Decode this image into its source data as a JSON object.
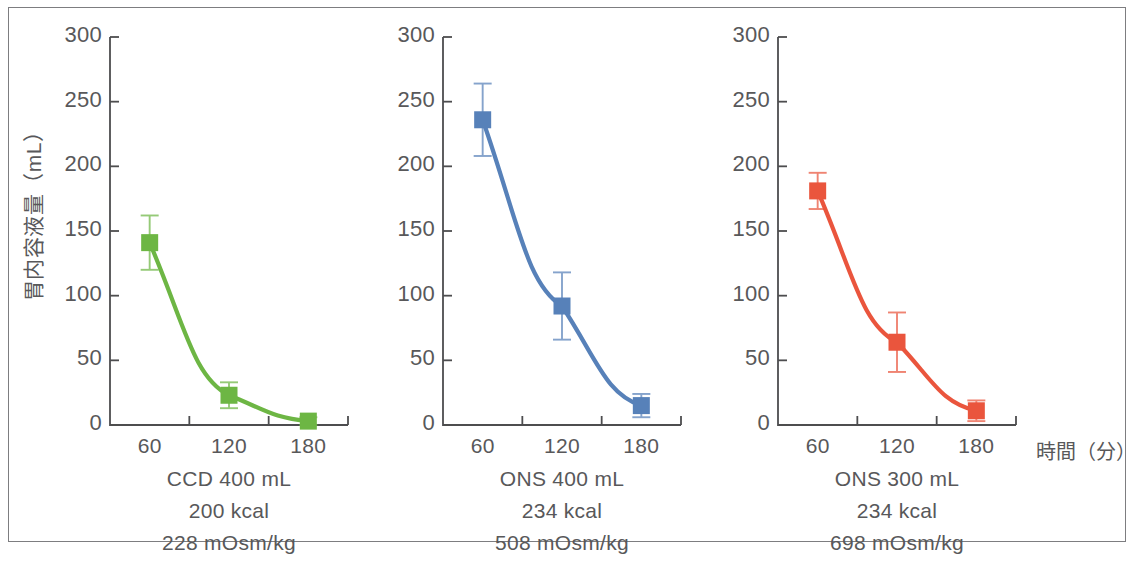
{
  "figure": {
    "y_axis_title": "胃内容液量（mL）",
    "x_axis_title": "時間（分）"
  },
  "chart_data": {
    "type": "line",
    "title": "",
    "subtitle": "",
    "xlabel": "時間（分）",
    "ylabel": "胃内容液量（mL）",
    "x": [
      60,
      120,
      180
    ],
    "xlim": [
      30,
      210
    ],
    "ylim": [
      0,
      300
    ],
    "yticks": [
      0,
      50,
      100,
      150,
      200,
      250,
      300
    ],
    "xticks": [
      60,
      120,
      180
    ],
    "grid": false,
    "legend": "none",
    "marker": "square",
    "error_bars": "mean ± SD",
    "panels": [
      {
        "id": "panel-ccd-400",
        "caption_lines": [
          "CCD 400 mL",
          "200 kcal",
          "228 mOsm/kg"
        ],
        "product": "CCD 400 mL",
        "energy": "200 kcal",
        "osmolality": "228 mOsm/kg",
        "color": "#6DB644",
        "series_name": "CCD 400 mL",
        "values": [
          141,
          23,
          3
        ],
        "errors": [
          21,
          10,
          3
        ]
      },
      {
        "id": "panel-ons-400",
        "caption_lines": [
          "ONS 400 mL",
          "234 kcal",
          "508 mOsm/kg"
        ],
        "product": "ONS 400 mL",
        "energy": "234 kcal",
        "osmolality": "508 mOsm/kg",
        "color": "#5781B9",
        "series_name": "ONS 400 mL",
        "values": [
          236,
          92,
          15
        ],
        "errors": [
          28,
          26,
          9
        ]
      },
      {
        "id": "panel-ons-300",
        "caption_lines": [
          "ONS 300 mL",
          "234 kcal",
          "698 mOsm/kg"
        ],
        "product": "ONS 300 mL",
        "energy": "234 kcal",
        "osmolality": "698 mOsm/kg",
        "color": "#EA553D",
        "series_name": "ONS 300 mL",
        "values": [
          181,
          64,
          11
        ],
        "errors": [
          14,
          23,
          8
        ]
      }
    ],
    "ytick_labels": [
      "0",
      "50",
      "100",
      "150",
      "200",
      "250",
      "300"
    ],
    "xtick_labels": [
      "60",
      "120",
      "180"
    ]
  }
}
